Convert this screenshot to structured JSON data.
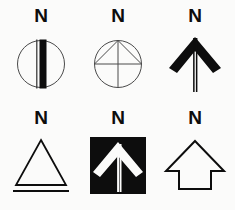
{
  "page": {
    "background_color": "#fbfbfa",
    "ink_color": "#0d0d0d",
    "line_color": "#3a3a3a",
    "width": 235,
    "height": 210
  },
  "symbols": [
    {
      "id": "north-arrow-circle-bar",
      "label": "N",
      "shape_name": "circle-with-vertical-bar",
      "row": 1,
      "column": 1
    },
    {
      "id": "north-arrow-circle-cross-rays",
      "label": "N",
      "shape_name": "circle-with-cross-and-diagonals",
      "row": 1,
      "column": 2
    },
    {
      "id": "north-arrow-chevron",
      "label": "N",
      "shape_name": "thin-shaft-chevron-arrow",
      "row": 1,
      "column": 3
    },
    {
      "id": "north-arrow-triangle-baseline",
      "label": "N",
      "shape_name": "outline-triangle-with-baseline",
      "row": 2,
      "column": 1
    },
    {
      "id": "north-arrow-inverted-square",
      "label": "N",
      "shape_name": "white-chevron-on-black-square",
      "row": 2,
      "column": 2
    },
    {
      "id": "north-arrow-block",
      "label": "N",
      "shape_name": "outline-block-arrow",
      "row": 2,
      "column": 3
    }
  ]
}
